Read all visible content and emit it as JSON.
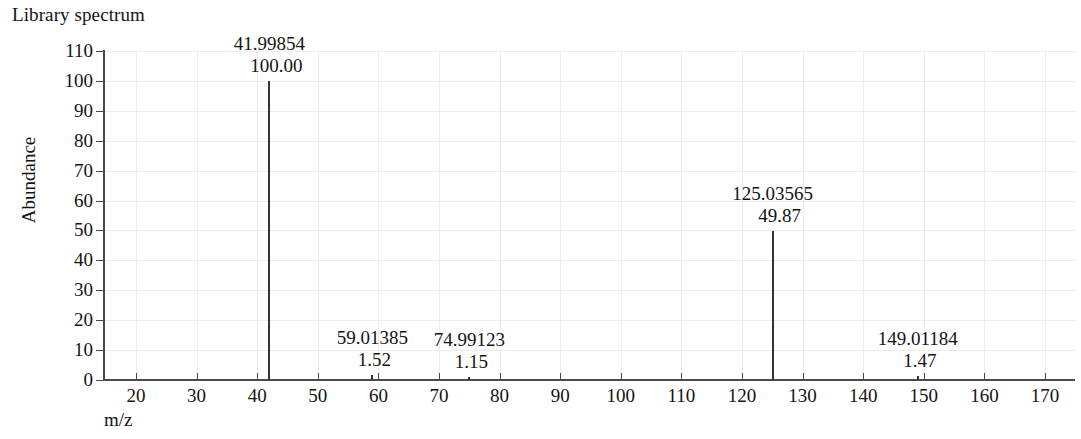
{
  "title": "Library spectrum",
  "axes": {
    "ylabel": "Abundance",
    "xlabel": "m/z",
    "yticks": [
      "0",
      "10",
      "20",
      "30",
      "40",
      "50",
      "60",
      "70",
      "80",
      "90",
      "100",
      "110"
    ],
    "xticks": [
      "20",
      "30",
      "40",
      "50",
      "60",
      "70",
      "80",
      "90",
      "100",
      "110",
      "120",
      "130",
      "140",
      "150",
      "160",
      "170"
    ]
  },
  "colors": {
    "axis": "#4a4a4a",
    "peak": "#333338",
    "grid": "#ededf0",
    "text": "#141414",
    "background": "#ffffff"
  },
  "peaks": [
    {
      "mz_label": "41.99854",
      "abundance_label": "100.00",
      "mz": 41.99854,
      "abundance": 100.0
    },
    {
      "mz_label": "59.01385",
      "abundance_label": "1.52",
      "mz": 59.01385,
      "abundance": 1.52
    },
    {
      "mz_label": "74.99123",
      "abundance_label": "1.15",
      "mz": 74.99123,
      "abundance": 1.15
    },
    {
      "mz_label": "125.03565",
      "abundance_label": "49.87",
      "mz": 125.03565,
      "abundance": 49.87
    },
    {
      "mz_label": "149.01184",
      "abundance_label": "1.47",
      "mz": 149.01184,
      "abundance": 1.47
    }
  ],
  "chart_data": {
    "type": "bar",
    "title": "Library spectrum",
    "xlabel": "m/z",
    "ylabel": "Abundance",
    "xlim": [
      14.5,
      175
    ],
    "ylim": [
      0,
      110
    ],
    "grid": true,
    "legend": null,
    "categories": [
      41.99854,
      59.01385,
      74.99123,
      125.03565,
      149.01184
    ],
    "values": [
      100.0,
      1.52,
      1.15,
      49.87,
      1.47
    ],
    "xticks": [
      20,
      30,
      40,
      50,
      60,
      70,
      80,
      90,
      100,
      110,
      120,
      130,
      140,
      150,
      160,
      170
    ],
    "yticks": [
      0,
      10,
      20,
      30,
      40,
      50,
      60,
      70,
      80,
      90,
      100,
      110
    ],
    "annotations": [
      {
        "x": 41.99854,
        "y": 100.0,
        "text": "41.99854\n100.00"
      },
      {
        "x": 59.01385,
        "y": 1.52,
        "text": "59.01385\n1.52"
      },
      {
        "x": 74.99123,
        "y": 1.15,
        "text": "74.99123\n1.15"
      },
      {
        "x": 125.03565,
        "y": 49.87,
        "text": "125.03565\n49.87"
      },
      {
        "x": 149.01184,
        "y": 1.47,
        "text": "149.01184\n1.47"
      }
    ]
  }
}
